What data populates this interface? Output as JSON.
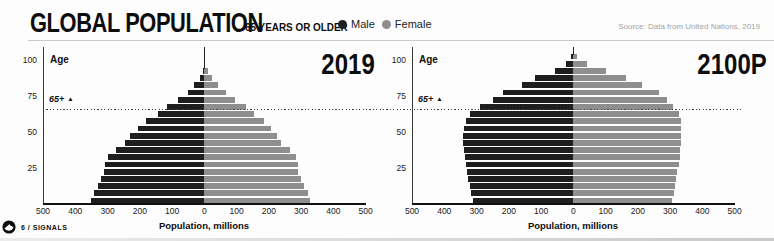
{
  "header": {
    "title": "GLOBAL POPULATION",
    "subtitle": "65 YEARS OR OLDER",
    "legend": [
      {
        "label": "Male",
        "color": "#1e1e1e"
      },
      {
        "label": "Female",
        "color": "#8e8e8e"
      }
    ],
    "source": "Source: Data from United Nations, 2019"
  },
  "footer": {
    "page_label": "6 / SIGNALS"
  },
  "chart_data": [
    {
      "type": "bar",
      "subtype": "population-pyramid",
      "title": "2019",
      "age_axis_label": "Age",
      "xlabel": "Population, millions",
      "annotation": "65+",
      "annotation_age": 65,
      "xlim_each_side": 500,
      "x_ticks": [
        "500",
        "400",
        "300",
        "200",
        "100",
        "0",
        "100",
        "200",
        "300",
        "400",
        "500"
      ],
      "y_ticks": [
        "25",
        "50",
        "75",
        "100"
      ],
      "age_groups": [
        "0-4",
        "5-9",
        "10-14",
        "15-19",
        "20-24",
        "25-29",
        "30-34",
        "35-39",
        "40-44",
        "45-49",
        "50-54",
        "55-59",
        "60-64",
        "65-69",
        "70-74",
        "75-79",
        "80-84",
        "85-89",
        "90-94",
        "95-99",
        "100+"
      ],
      "series": [
        {
          "name": "Male",
          "color": "#1e1e1e",
          "values": [
            350,
            342,
            331,
            320,
            311,
            307,
            300,
            275,
            245,
            230,
            207,
            180,
            145,
            115,
            80,
            51,
            31,
            14,
            5,
            1,
            0.2
          ]
        },
        {
          "name": "Female",
          "color": "#8e8e8e",
          "values": [
            327,
            320,
            310,
            299,
            291,
            290,
            285,
            265,
            238,
            226,
            207,
            184,
            154,
            128,
            95,
            66,
            44,
            24,
            10,
            3,
            0.5
          ]
        }
      ]
    },
    {
      "type": "bar",
      "subtype": "population-pyramid",
      "title": "2100P",
      "age_axis_label": "Age",
      "xlabel": "Population, millions",
      "annotation": "65+",
      "annotation_age": 65,
      "xlim_each_side": 500,
      "x_ticks": [
        "500",
        "400",
        "300",
        "200",
        "100",
        "0",
        "100",
        "200",
        "300",
        "400",
        "500"
      ],
      "y_ticks": [
        "25",
        "50",
        "75",
        "100"
      ],
      "age_groups": [
        "0-4",
        "5-9",
        "10-14",
        "15-19",
        "20-24",
        "25-29",
        "30-34",
        "35-39",
        "40-44",
        "45-49",
        "50-54",
        "55-59",
        "60-64",
        "65-69",
        "70-74",
        "75-79",
        "80-84",
        "85-89",
        "90-94",
        "95-99",
        "100+"
      ],
      "series": [
        {
          "name": "Male",
          "color": "#1e1e1e",
          "values": [
            312,
            317,
            321,
            325,
            330,
            334,
            337,
            339,
            341,
            341,
            339,
            334,
            320,
            290,
            249,
            218,
            160,
            118,
            56,
            23,
            7
          ]
        },
        {
          "name": "Female",
          "color": "#8e8e8e",
          "values": [
            306,
            311,
            315,
            319,
            323,
            327,
            330,
            332,
            334,
            335,
            335,
            333,
            327,
            310,
            291,
            266,
            214,
            164,
            100,
            43,
            12
          ]
        }
      ]
    }
  ]
}
